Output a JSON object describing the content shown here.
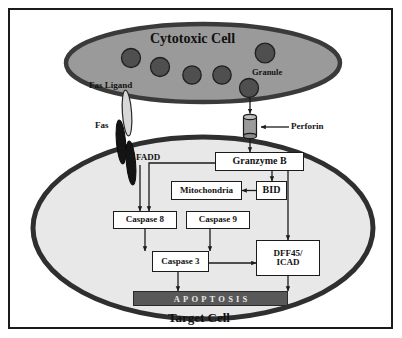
{
  "figure": {
    "background": "#ffffff",
    "frame_color": "#1b1b1b"
  },
  "colors": {
    "cytotoxic_cytoplasm": "#9a9a9a",
    "cytotoxic_membrane": "#3a3a3a",
    "target_cytoplasm": "#e8e8e8",
    "target_membrane": "#2f2f2f",
    "granule_fill": "#4f4f4f",
    "granule_stroke": "#1f1f1f",
    "fas_ligand_fill": "#d8d8d8",
    "fas_receptor_fill": "#141414",
    "perforin_fill": "#9b9b9b",
    "apoptosis_bar": "#585858",
    "apoptosis_text": "#e8e8e8",
    "box_fill": "#ffffff",
    "box_stroke": "#1b1b1b",
    "arrow": "#1b1b1b"
  },
  "cells": {
    "cytotoxic": {
      "label": "Cytotoxic Cell",
      "granule_label": "Granule",
      "granule_count": 6
    },
    "target": {
      "label": "Target Cell"
    }
  },
  "membrane_labels": {
    "fas_ligand": "Fas Ligand",
    "fas": "Fas",
    "perforin": "Perforin",
    "fadd": "FADD"
  },
  "nodes": [
    {
      "id": "granzyme_b",
      "label": "Granzyme B"
    },
    {
      "id": "mitochondria",
      "label": "Mitochondria"
    },
    {
      "id": "bid",
      "label": "BID"
    },
    {
      "id": "caspase8",
      "label": "Caspase 8"
    },
    {
      "id": "caspase9",
      "label": "Caspase 9"
    },
    {
      "id": "caspase3",
      "label": "Caspase 3"
    },
    {
      "id": "dff45_icad",
      "label": "DFF45/\nICAD"
    },
    {
      "id": "dff45_line1",
      "label": "DFF45/"
    },
    {
      "id": "dff45_line2",
      "label": "ICAD"
    }
  ],
  "outcome": {
    "label": "APOPTOSIS"
  },
  "edges": [
    {
      "from": "granule",
      "to": "perforin_channel"
    },
    {
      "from": "perforin_channel",
      "to": "granzyme_b"
    },
    {
      "from": "perforin_label",
      "to": "perforin_channel"
    },
    {
      "from": "granzyme_b",
      "to": "bid"
    },
    {
      "from": "bid",
      "to": "mitochondria"
    },
    {
      "from": "granzyme_b",
      "to": "caspase8"
    },
    {
      "from": "granzyme_b",
      "to": "dff45_icad"
    },
    {
      "from": "fadd",
      "to": "caspase8"
    },
    {
      "from": "caspase8",
      "to": "caspase3"
    },
    {
      "from": "caspase9",
      "to": "caspase3"
    },
    {
      "from": "caspase3",
      "to": "dff45_icad"
    },
    {
      "from": "caspase3",
      "to": "apoptosis"
    },
    {
      "from": "dff45_icad",
      "to": "apoptosis"
    }
  ]
}
